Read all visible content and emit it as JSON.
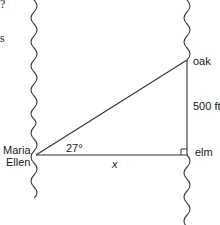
{
  "diagram": {
    "type": "right-triangle-river-problem",
    "labels": {
      "observer_line1": "Maria",
      "observer_line2": "Ellen",
      "angle": "27°",
      "base": "x",
      "opposite_side": "500 ft",
      "top_vertex": "oak",
      "right_angle_vertex": "elm"
    },
    "cropped_text_fragments": [
      "?",
      "s"
    ],
    "geometry": {
      "observer_point": [
        36,
        155
      ],
      "oak_point": [
        187,
        60
      ],
      "elm_point": [
        187,
        155
      ],
      "angle_deg": 27,
      "opposite_length_ft": 500
    },
    "colors": {
      "line": "#333333",
      "text": "#1a1a1a",
      "background": "#ffffff"
    }
  }
}
